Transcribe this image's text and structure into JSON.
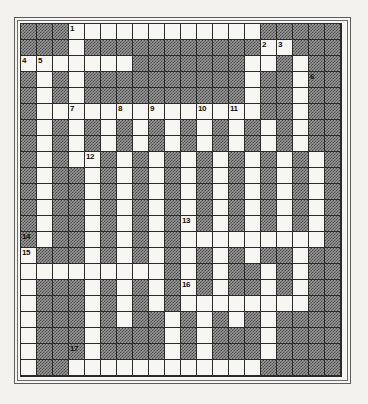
{
  "puzzle": {
    "type": "crossword-grid",
    "title": "",
    "columns": 20,
    "rows": 22,
    "cell_size_px": 16,
    "colors": {
      "page_background": "#f3f2ef",
      "open_cell": "#f7f6f3",
      "block_cell_base": "#9a9a9a",
      "block_cell_hatch": "#4a4a4a",
      "grid_line": "#2b2b2b",
      "frame_border": "#5c5c5c",
      "number_text": "#14110f"
    },
    "legend": {
      "open_cell_meaning": "fillable letter square",
      "block_cell_meaning": "hatched blocked square"
    },
    "clue_numbers": [
      {
        "number": "1",
        "row": 1,
        "col": 4
      },
      {
        "number": "2",
        "row": 2,
        "col": 16
      },
      {
        "number": "3",
        "row": 2,
        "col": 17
      },
      {
        "number": "4",
        "row": 3,
        "col": 1
      },
      {
        "number": "5",
        "row": 3,
        "col": 2
      },
      {
        "number": "6",
        "row": 4,
        "col": 19
      },
      {
        "number": "7",
        "row": 6,
        "col": 4
      },
      {
        "number": "8",
        "row": 6,
        "col": 7
      },
      {
        "number": "9",
        "row": 6,
        "col": 9
      },
      {
        "number": "10",
        "row": 6,
        "col": 12
      },
      {
        "number": "11",
        "row": 6,
        "col": 14
      },
      {
        "number": "12",
        "row": 9,
        "col": 5
      },
      {
        "number": "13",
        "row": 13,
        "col": 11
      },
      {
        "number": "14",
        "row": 14,
        "col": 1
      },
      {
        "number": "15",
        "row": 15,
        "col": 1
      },
      {
        "number": "16",
        "row": 17,
        "col": 11
      },
      {
        "number": "17",
        "row": 21,
        "col": 4
      }
    ],
    "grid": [
      "###OOOOOOOOOOOO#####",
      "###O###########OO###",
      "OOOOOOO#######OO#O##",
      "#O#O##########O##O##",
      "#O#O##########O##O##",
      "#OOOOOOOOOOOOOO##O##",
      "#O#O#O#O#O#O#O#O#O##",
      "#O#O#O#O#O#O#O#O#O##",
      "#O#OO#O#O#O#O#O#O#O#",
      "#O##O#O#O#O#O#O#O#O#",
      "#O##O#O#O#O#O#O#O#O#",
      "#O##O#O#O#O#O#O#O#O#",
      "#O##O#O#O#O#O#O#O#O#",
      "#O##O#O#O#OOOOOOOOO#",
      "O###O#O#O#O#O#O##O##",
      "OOOOOOOOO#O#O##O#O##",
      "O###O#O#O#O#O##O#O##",
      "O###O#O#O#OOOOOOOO##",
      "O###O#O##O#O#O#O####",
      "O###O####O#O###O####",
      "O###O####O#O###O####",
      "O##OOOOOOOOOOOO#####",
      "O###O###############"
    ]
  }
}
